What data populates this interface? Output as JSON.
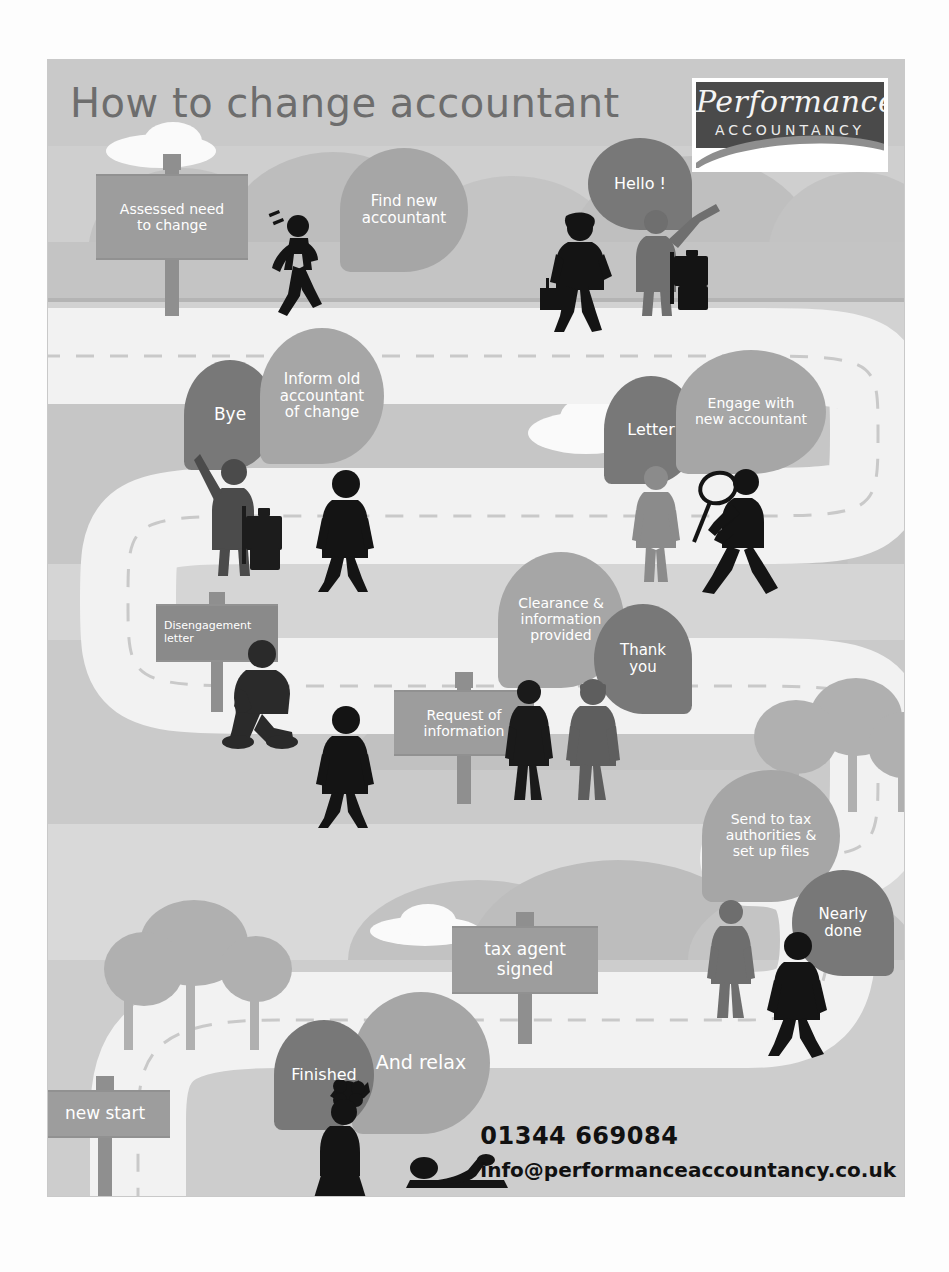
{
  "poster": {
    "title": "How to change accountant",
    "logo": {
      "script": "Performance",
      "subtitle": "ACCOUNTANCY"
    },
    "contact": {
      "phone": "01344 669084",
      "email": "info@performanceaccountancy.co.uk"
    },
    "colors": {
      "paper": "#d8d8d8",
      "bubble_dark": "#787878",
      "bubble_light": "#a6a6a6",
      "sign": "#9d9d9d",
      "road": "#f2f2f2",
      "silhouette_dark": "#141414",
      "silhouette_mid": "#6f6f6f",
      "title_text": "#6d6d6d",
      "contact_text": "#111111"
    }
  },
  "steps": [
    {
      "id": "assessed-need",
      "kind": "sign",
      "label": "Assessed need\nto change"
    },
    {
      "id": "find-new",
      "kind": "bubble-light",
      "label": "Find new\naccountant"
    },
    {
      "id": "hello",
      "kind": "bubble-dark",
      "label": "Hello !"
    },
    {
      "id": "bye",
      "kind": "bubble-dark",
      "label": "Bye"
    },
    {
      "id": "inform-old",
      "kind": "bubble-light",
      "label": "Inform old\naccountant\nof change"
    },
    {
      "id": "letter",
      "kind": "bubble-dark",
      "label": "Letter"
    },
    {
      "id": "engage-new",
      "kind": "bubble-light",
      "label": "Engage with\nnew accountant"
    },
    {
      "id": "disengagement",
      "kind": "sign",
      "label": "Disengagement\nletter"
    },
    {
      "id": "clearance",
      "kind": "bubble-light",
      "label": "Clearance &\ninformation\nprovided"
    },
    {
      "id": "thank-you",
      "kind": "bubble-dark",
      "label": "Thank\nyou"
    },
    {
      "id": "request-info",
      "kind": "sign",
      "label": "Request of\ninformation"
    },
    {
      "id": "send-tax",
      "kind": "bubble-light",
      "label": "Send to tax\nauthorities &\nset up files"
    },
    {
      "id": "nearly-done",
      "kind": "bubble-dark",
      "label": "Nearly\ndone"
    },
    {
      "id": "tax-agent-signed",
      "kind": "sign",
      "label": "tax agent\nsigned"
    },
    {
      "id": "and-relax",
      "kind": "bubble-light",
      "label": "And relax"
    },
    {
      "id": "finished",
      "kind": "bubble-dark",
      "label": "Finished"
    },
    {
      "id": "new-start",
      "kind": "sign",
      "label": "new start"
    }
  ],
  "labels": {
    "assessed_need": "Assessed need\nto change",
    "find_new": "Find new\naccountant",
    "hello": "Hello !",
    "bye": "Bye",
    "inform_old": "Inform old\naccountant\nof change",
    "letter": "Letter",
    "engage_new": "Engage with\nnew accountant",
    "disengagement": "Disengagement\nletter",
    "clearance": "Clearance &\ninformation\nprovided",
    "thank_you": "Thank\nyou",
    "request_info": "Request of\ninformation",
    "send_tax": "Send to tax\nauthorities &\nset up files",
    "nearly_done": "Nearly\ndone",
    "tax_agent": "tax agent\nsigned",
    "and_relax": "And relax",
    "finished": "Finished",
    "new_start": "new start"
  }
}
